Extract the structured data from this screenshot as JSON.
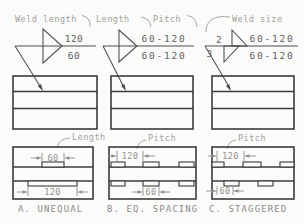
{
  "panels": {
    "a": {
      "annotation": "Weld length",
      "symbol": {
        "above_line": "120",
        "below_line": "60"
      },
      "detail": {
        "label": "Length",
        "top_dim": "60",
        "bottom_dim": "120"
      },
      "caption": "A. UNEQUAL"
    },
    "b": {
      "annotation_length": "Length",
      "annotation_pitch": "Pitch",
      "symbol": {
        "above_line": "60-120",
        "below_line": "60-120"
      },
      "detail": {
        "label": "Pitch",
        "top_dim": "120",
        "bottom_dim": "60"
      },
      "caption": "B. EQ. SPACING"
    },
    "c": {
      "annotation": "Weld size",
      "symbol": {
        "size_above": "2",
        "size_below": "3",
        "above_line": "60-120",
        "below_line": "60-120"
      },
      "detail": {
        "label": "Pitch",
        "top_dim": "120",
        "bottom_dim": "60"
      },
      "caption": "C. STAGGERED"
    }
  },
  "colors": {
    "background": "#fbfbf9",
    "drawing_line": "#3b3b3b",
    "symbol_line": "#4d4d4d",
    "symbol_text": "#5f5f5f",
    "annotation_text": "#a0a0a0",
    "dimension": "#8f8f8f",
    "caption_text": "#8a8a8a"
  }
}
